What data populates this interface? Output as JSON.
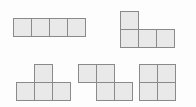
{
  "figure": {
    "canvas": {
      "width": 196,
      "height": 107
    },
    "colors": {
      "background": "#fdfdfd",
      "cell_fill": "#e9e9e9",
      "cell_border": "#8a8a8a"
    },
    "cell_size": 19,
    "shapes": [
      {
        "id": "shape-i-tetromino",
        "name": "I-tetromino",
        "label": "horizontal bar of four squares",
        "cell_count": 4,
        "origin": {
          "x": 13,
          "y": 18
        },
        "cells": [
          {
            "col": 0,
            "row": 0
          },
          {
            "col": 1,
            "row": 0
          },
          {
            "col": 2,
            "row": 0
          },
          {
            "col": 3,
            "row": 0
          }
        ]
      },
      {
        "id": "shape-j-tetromino",
        "name": "J-tetromino",
        "label": "one square above the left end of a row of three squares",
        "cell_count": 4,
        "origin": {
          "x": 120,
          "y": 11
        },
        "cells": [
          {
            "col": 0,
            "row": 0
          },
          {
            "col": 0,
            "row": 1
          },
          {
            "col": 1,
            "row": 1
          },
          {
            "col": 2,
            "row": 1
          }
        ]
      },
      {
        "id": "shape-t-tetromino",
        "name": "T-tetromino",
        "label": "one square above the middle of a row of three squares",
        "cell_count": 4,
        "origin": {
          "x": 16,
          "y": 64
        },
        "cells": [
          {
            "col": 1,
            "row": 0
          },
          {
            "col": 0,
            "row": 1
          },
          {
            "col": 1,
            "row": 1
          },
          {
            "col": 2,
            "row": 1
          }
        ]
      },
      {
        "id": "shape-s-tetromino",
        "name": "S-tetromino",
        "label": "two squares on top offset left above two squares offset right",
        "cell_count": 4,
        "origin": {
          "x": 78,
          "y": 64
        },
        "cells": [
          {
            "col": 0,
            "row": 0
          },
          {
            "col": 1,
            "row": 0
          },
          {
            "col": 1,
            "row": 1
          },
          {
            "col": 2,
            "row": 1
          }
        ]
      },
      {
        "id": "shape-o-tetromino",
        "name": "O-tetromino",
        "label": "two by two square block",
        "cell_count": 4,
        "origin": {
          "x": 139,
          "y": 64
        },
        "cells": [
          {
            "col": 0,
            "row": 0
          },
          {
            "col": 1,
            "row": 0
          },
          {
            "col": 0,
            "row": 1
          },
          {
            "col": 1,
            "row": 1
          }
        ]
      }
    ]
  }
}
